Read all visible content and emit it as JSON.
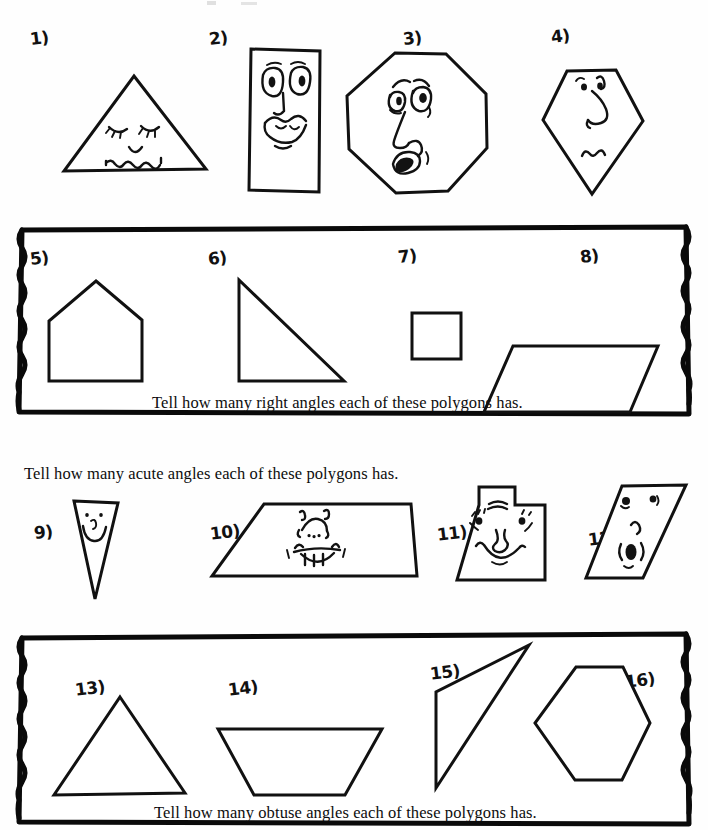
{
  "worksheet": {
    "page_width": 708,
    "page_height": 830,
    "ink_color": "#111111",
    "paper_color": "#fefefe"
  },
  "sections": [
    {
      "id": "section-right-angles",
      "instruction": "Tell how many right angles each of these polygons has.",
      "boxed": true,
      "items": [
        "5)",
        "6)",
        "7)",
        "8)"
      ]
    },
    {
      "id": "section-acute-angles",
      "instruction": "Tell how many acute angles each of these polygons has.",
      "boxed": false,
      "items": [
        "9)",
        "10)",
        "11)",
        "12)"
      ]
    },
    {
      "id": "section-obtuse-angles",
      "instruction": "Tell how many obtuse angles each of these polygons has.",
      "boxed": true,
      "items": [
        "13)",
        "14)",
        "15)",
        "16)"
      ]
    }
  ],
  "problems": [
    {
      "label": "1)",
      "shape": "triangle",
      "face": true,
      "face_type": "sleepy-wavy-mouth"
    },
    {
      "label": "2)",
      "shape": "vertical-rectangle",
      "face": true,
      "face_type": "big-eyes-wide-mouth"
    },
    {
      "label": "3)",
      "shape": "octagon",
      "face": true,
      "face_type": "surprised-open-mouth"
    },
    {
      "label": "4)",
      "shape": "kite-pentagon",
      "face": true,
      "face_type": "long-nose-small-mouth"
    },
    {
      "label": "5)",
      "shape": "house-pentagon",
      "face": false,
      "face_type": ""
    },
    {
      "label": "6)",
      "shape": "right-triangle",
      "face": false,
      "face_type": ""
    },
    {
      "label": "7)",
      "shape": "square",
      "face": false,
      "face_type": ""
    },
    {
      "label": "8)",
      "shape": "parallelogram",
      "face": false,
      "face_type": ""
    },
    {
      "label": "9)",
      "shape": "narrow-inverted-triangle",
      "face": true,
      "face_type": "smiley"
    },
    {
      "label": "10)",
      "shape": "trapezoid",
      "face": true,
      "face_type": "toothy-grin"
    },
    {
      "label": "11)",
      "shape": "tabbed-square",
      "face": true,
      "face_type": "smiling-man"
    },
    {
      "label": "12)",
      "shape": "slanted-parallelogram",
      "face": true,
      "face_type": "oval-mouth"
    },
    {
      "label": "13)",
      "shape": "acute-triangle",
      "face": false,
      "face_type": ""
    },
    {
      "label": "14)",
      "shape": "inverted-trapezoid",
      "face": false,
      "face_type": ""
    },
    {
      "label": "15)",
      "shape": "thin-obtuse-triangle",
      "face": false,
      "face_type": ""
    },
    {
      "label": "16)",
      "shape": "hexagon",
      "face": false,
      "face_type": ""
    }
  ]
}
